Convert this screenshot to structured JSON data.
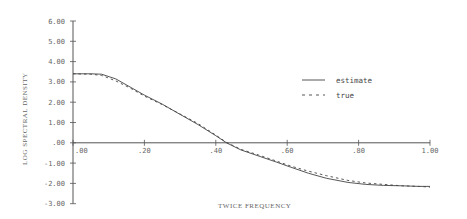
{
  "chart_data": {
    "type": "line",
    "title": "",
    "xlabel": "TWICE FREQUENCY",
    "ylabel": "LOG SPECTRAL DENSITY",
    "xlim": [
      0,
      1
    ],
    "ylim": [
      -3,
      6
    ],
    "x_ticks": [
      ".00",
      ".20",
      ".40",
      ".60",
      ".80",
      "1.00"
    ],
    "y_ticks": [
      "6.00",
      "5.00",
      "4.00",
      "3.00",
      "2.00",
      "1.00",
      ".00",
      "-1.00",
      "-2.00",
      "-3.00"
    ],
    "grid": false,
    "legend_position": "upper right",
    "x": [
      0.0,
      0.05,
      0.08,
      0.12,
      0.16,
      0.2,
      0.25,
      0.3,
      0.35,
      0.4,
      0.43,
      0.47,
      0.52,
      0.57,
      0.61,
      0.66,
      0.71,
      0.77,
      0.82,
      0.87,
      0.92,
      0.97,
      1.0
    ],
    "series": [
      {
        "name": "estimate",
        "style": "solid",
        "values": [
          3.4,
          3.4,
          3.38,
          3.15,
          2.75,
          2.35,
          1.9,
          1.4,
          0.9,
          0.35,
          0.0,
          -0.35,
          -0.65,
          -0.95,
          -1.2,
          -1.5,
          -1.75,
          -1.95,
          -2.05,
          -2.1,
          -2.12,
          -2.15,
          -2.15
        ]
      },
      {
        "name": "true",
        "style": "dashed",
        "values": [
          3.4,
          3.38,
          3.32,
          3.05,
          2.7,
          2.3,
          1.88,
          1.42,
          0.95,
          0.38,
          0.02,
          -0.32,
          -0.6,
          -0.9,
          -1.15,
          -1.4,
          -1.62,
          -1.85,
          -1.98,
          -2.05,
          -2.12,
          -2.15,
          -2.18
        ]
      }
    ]
  },
  "legend": {
    "items": [
      {
        "label": "estimate",
        "style": "solid"
      },
      {
        "label": "true",
        "style": "dashed"
      }
    ]
  },
  "axes": {
    "xlabel": "TWICE FREQUENCY",
    "ylabel": "LOG SPECTRAL DENSITY"
  },
  "colors": {
    "line": "#444444",
    "axis": "#555555",
    "text": "#666666"
  }
}
